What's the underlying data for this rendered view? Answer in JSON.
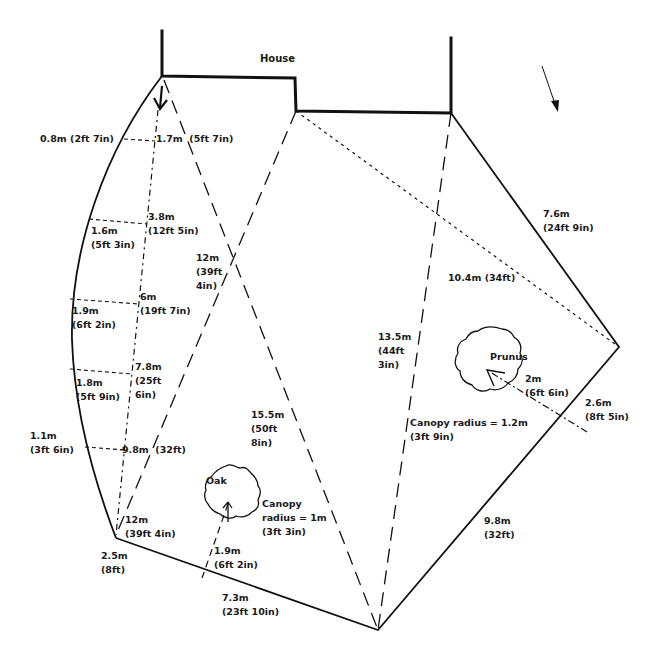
{
  "diagram": {
    "type": "garden-survey-plan",
    "colors": {
      "ink": "#111111",
      "background": "#ffffff"
    },
    "house": {
      "label": "House"
    },
    "north_arrow": {
      "icon": "direction-arrow-icon"
    },
    "trees": [
      {
        "name": "Oak",
        "canopy_label": [
          "Canopy",
          "radius = 1m",
          "(3ft 3in)"
        ],
        "distance_label": [
          "1.9m",
          "(6ft 2in)"
        ]
      },
      {
        "name": "Prunus",
        "canopy_label": [
          "Canopy radius = 1.2m",
          "(3ft 9in)"
        ],
        "distance_label": [
          "2m",
          "(6ft 6in)"
        ]
      }
    ],
    "boundary_labels": [
      {
        "id": "b1",
        "lines": [
          "7.6m",
          "(24ft 9in)"
        ]
      },
      {
        "id": "b2",
        "lines": [
          "2.6m",
          "(8ft 5in)"
        ]
      },
      {
        "id": "b3",
        "lines": [
          "9.8m",
          "(32ft)"
        ]
      },
      {
        "id": "b4",
        "lines": [
          "7.3m",
          "(23ft 10in)"
        ]
      },
      {
        "id": "b5",
        "lines": [
          "2.5m",
          "(8ft)"
        ]
      }
    ],
    "diagonal_labels": [
      {
        "id": "d1",
        "lines": [
          "12m",
          "(39ft",
          "4in)"
        ]
      },
      {
        "id": "d2",
        "lines": [
          "15.5m",
          "(50ft",
          "8in)"
        ]
      },
      {
        "id": "d3",
        "lines": [
          "13.5m",
          "(44ft",
          "3in)"
        ]
      },
      {
        "id": "d4",
        "lines": [
          "10.4m (34ft)"
        ]
      },
      {
        "id": "d5",
        "lines": [
          "12m",
          "(39ft 4in)"
        ]
      }
    ],
    "baseline_labels": [
      {
        "id": "s1",
        "lines": [
          "1.7m  (5ft 7in)"
        ]
      },
      {
        "id": "s2",
        "lines": [
          "3.8m",
          "(12ft 5in)"
        ]
      },
      {
        "id": "s3",
        "lines": [
          "6m",
          "(19ft 7in)"
        ]
      },
      {
        "id": "s4",
        "lines": [
          "7.8m",
          "(25ft",
          "6in)"
        ]
      },
      {
        "id": "s5",
        "lines": [
          "9.8m  (32ft)"
        ]
      }
    ],
    "offset_labels": [
      {
        "id": "o1",
        "lines": [
          "0.8m (2ft 7in)"
        ]
      },
      {
        "id": "o2",
        "lines": [
          "1.6m",
          "(5ft 3in)"
        ]
      },
      {
        "id": "o3",
        "lines": [
          "1.9m",
          "(6ft 2in)"
        ]
      },
      {
        "id": "o4",
        "lines": [
          "1.8m",
          "(5ft 9in)"
        ]
      },
      {
        "id": "o5",
        "lines": [
          "1.1m",
          "(3ft 6in)"
        ]
      }
    ]
  }
}
